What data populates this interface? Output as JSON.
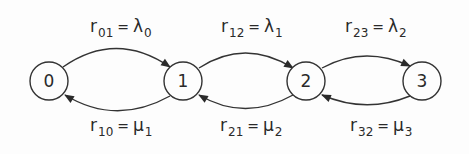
{
  "diagram": {
    "type": "birth-death state transition diagram",
    "nodes": [
      {
        "id": "0",
        "label": "0",
        "cx": 49,
        "cy": 81
      },
      {
        "id": "1",
        "label": "1",
        "cx": 183,
        "cy": 81
      },
      {
        "id": "2",
        "label": "2",
        "cx": 306,
        "cy": 81
      },
      {
        "id": "3",
        "label": "3",
        "cx": 422,
        "cy": 81
      }
    ],
    "edges": [
      {
        "from": "0",
        "to": "1",
        "rate": "r",
        "rate_sub": "01",
        "eq": "=",
        "value": "λ",
        "value_sub": "0",
        "position": "top"
      },
      {
        "from": "1",
        "to": "2",
        "rate": "r",
        "rate_sub": "12",
        "eq": "=",
        "value": "λ",
        "value_sub": "1",
        "position": "top"
      },
      {
        "from": "2",
        "to": "3",
        "rate": "r",
        "rate_sub": "23",
        "eq": "=",
        "value": "λ",
        "value_sub": "2",
        "position": "top"
      },
      {
        "from": "1",
        "to": "0",
        "rate": "r",
        "rate_sub": "10",
        "eq": "=",
        "value": "μ",
        "value_sub": "1",
        "position": "bottom"
      },
      {
        "from": "2",
        "to": "1",
        "rate": "r",
        "rate_sub": "21",
        "eq": "=",
        "value": "μ",
        "value_sub": "2",
        "position": "bottom"
      },
      {
        "from": "3",
        "to": "2",
        "rate": "r",
        "rate_sub": "32",
        "eq": "=",
        "value": "μ",
        "value_sub": "3",
        "position": "bottom"
      }
    ]
  }
}
